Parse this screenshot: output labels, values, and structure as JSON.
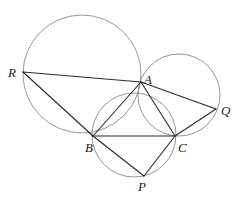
{
  "diagram": {
    "colors": {
      "background": "#ffffff",
      "circle": "#8a8a8a",
      "segment": "#2a2a2a",
      "label": "#222222"
    },
    "points": {
      "R": {
        "x": 23,
        "y": 72,
        "label": "R",
        "lx": 8,
        "ly": 77
      },
      "A": {
        "x": 141,
        "y": 82,
        "label": "A",
        "lx": 144,
        "ly": 84
      },
      "Q": {
        "x": 216,
        "y": 109,
        "label": "Q",
        "lx": 221,
        "ly": 115
      },
      "B": {
        "x": 93,
        "y": 136,
        "label": "B",
        "lx": 85,
        "ly": 152
      },
      "C": {
        "x": 175,
        "y": 136,
        "label": "C",
        "lx": 178,
        "ly": 152
      },
      "P": {
        "x": 144,
        "y": 176,
        "label": "P",
        "lx": 138,
        "ly": 191
      }
    },
    "circles": [
      {
        "name": "circle-ABR",
        "cx": 82,
        "cy": 74,
        "r": 59
      },
      {
        "name": "circle-ACQ",
        "cx": 179,
        "cy": 95,
        "r": 41
      },
      {
        "name": "circle-BCP",
        "cx": 134,
        "cy": 135,
        "r": 42
      }
    ],
    "segments": [
      [
        "R",
        "A"
      ],
      [
        "R",
        "B"
      ],
      [
        "A",
        "Q"
      ],
      [
        "Q",
        "C"
      ],
      [
        "A",
        "B"
      ],
      [
        "A",
        "C"
      ],
      [
        "B",
        "C"
      ],
      [
        "B",
        "P"
      ],
      [
        "P",
        "C"
      ]
    ]
  }
}
